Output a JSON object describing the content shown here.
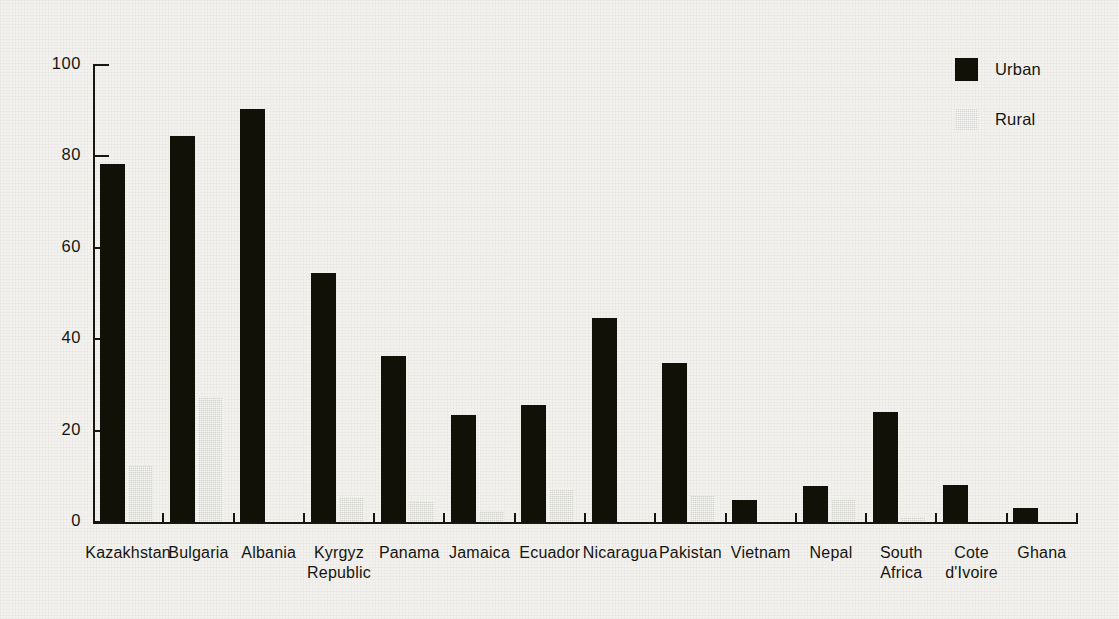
{
  "chart_data": {
    "type": "bar",
    "title": "",
    "subtitle": "",
    "xlabel": "",
    "ylabel": "",
    "ylim": [
      0,
      100
    ],
    "yticks": [
      0,
      20,
      40,
      60,
      80,
      100
    ],
    "ytick_labels": [
      "0",
      "20",
      "40",
      "60",
      "80",
      "100"
    ],
    "grid": false,
    "legend_position": "top-right",
    "categories": [
      "Kazakhstan",
      "Bulgaria",
      "Albania",
      "Kyrgyz\nRepublic",
      "Panama",
      "Jamaica",
      "Ecuador",
      "Nicaragua",
      "Pakistan",
      "Vietnam",
      "Nepal",
      "South\nAfrica",
      "Cote\nd'Ivoire",
      "Ghana"
    ],
    "series": [
      {
        "name": "Urban",
        "color": "#111108",
        "values": [
          78.3,
          84.4,
          90.4,
          54.5,
          36.4,
          23.5,
          25.6,
          44.7,
          34.8,
          4.9,
          7.9,
          24.0,
          8.0,
          3.0
        ]
      },
      {
        "name": "Rural",
        "color": "#d2d2cd",
        "values": [
          12.3,
          27.2,
          0.0,
          5.4,
          4.4,
          2.4,
          7.3,
          0.0,
          5.8,
          0.0,
          4.8,
          1.2,
          0.0,
          0.0
        ]
      }
    ]
  },
  "legend": {
    "items": [
      {
        "label": "Urban",
        "swatch": "urban"
      },
      {
        "label": "Rural",
        "swatch": "rural"
      }
    ]
  },
  "axes": {
    "y_tick_labels": [
      "100",
      "80",
      "60",
      "40",
      "20",
      "0"
    ]
  }
}
